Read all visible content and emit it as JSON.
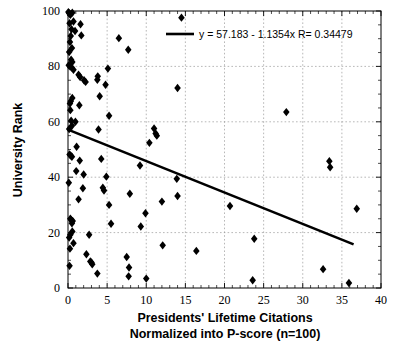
{
  "chart_data": {
    "type": "scatter",
    "title": "",
    "xlabel": "Presidents' Lifetime Citations",
    "xlabel_line2": "Normalized into P-score (n=100)",
    "ylabel": "University Rank",
    "xlim": [
      0,
      40
    ],
    "ylim": [
      0,
      100
    ],
    "xticks": [
      0,
      5,
      10,
      15,
      20,
      25,
      30,
      35,
      40
    ],
    "xtick_labels": [
      "0",
      "5",
      "10",
      "15",
      "20",
      "25",
      "30",
      "35",
      "40"
    ],
    "yticks": [
      0,
      20,
      40,
      60,
      80,
      100
    ],
    "ytick_labels": [
      "0",
      "20",
      "40",
      "60",
      "80",
      "100"
    ],
    "grid": true,
    "grid_style": "dotted",
    "minor_ticks": true,
    "legend": {
      "position": "top-right-inside",
      "entries": [
        {
          "label": "y = 57.183 - 1.1354x   R= 0.34479",
          "type": "line",
          "color": "#000000"
        }
      ]
    },
    "fit": {
      "type": "linear",
      "equation": "y = 57.183 - 1.1354x",
      "intercept": 57.183,
      "slope": -1.1354,
      "r_label": "R= 0.34479",
      "r": 0.34479,
      "x_start": 0,
      "x_end": 36.5,
      "color": "#000000"
    },
    "marker": {
      "shape": "diamond",
      "color": "#000000",
      "size": 4.2
    },
    "n_points": 100,
    "points": [
      [
        0.05,
        99.6
      ],
      [
        0.15,
        99.2
      ],
      [
        0.3,
        98.6
      ],
      [
        0.55,
        99.4
      ],
      [
        0.7,
        96.2
      ],
      [
        0.2,
        95.6
      ],
      [
        1.6,
        95.2
      ],
      [
        0.45,
        93.4
      ],
      [
        0.9,
        92.8
      ],
      [
        1.7,
        91.2
      ],
      [
        0.35,
        91.0
      ],
      [
        0.25,
        88.8
      ],
      [
        0.5,
        86.6
      ],
      [
        0.15,
        85.2
      ],
      [
        0.4,
        82.4
      ],
      [
        0.55,
        81.6
      ],
      [
        0.1,
        80.4
      ],
      [
        0.25,
        80.0
      ],
      [
        0.45,
        79.6
      ],
      [
        0.7,
        78.8
      ],
      [
        1.35,
        77.0
      ],
      [
        1.55,
        76.2
      ],
      [
        2.05,
        75.0
      ],
      [
        2.25,
        74.4
      ],
      [
        3.8,
        76.4
      ],
      [
        3.75,
        75.2
      ],
      [
        4.8,
        73.4
      ],
      [
        4.05,
        69.2
      ],
      [
        0.55,
        68.6
      ],
      [
        0.35,
        67.4
      ],
      [
        0.25,
        66.6
      ],
      [
        1.45,
        66.0
      ],
      [
        0.3,
        64.2
      ],
      [
        5.25,
        62.2
      ],
      [
        0.4,
        60.4
      ],
      [
        0.95,
        60.0
      ],
      [
        0.5,
        58.6
      ],
      [
        0.15,
        57.4
      ],
      [
        3.9,
        57.2
      ],
      [
        11.0,
        57.6
      ],
      [
        11.2,
        55.8
      ],
      [
        11.35,
        55.0
      ],
      [
        10.4,
        52.4
      ],
      [
        1.1,
        51.0
      ],
      [
        1.5,
        46.0
      ],
      [
        4.25,
        46.6
      ],
      [
        0.2,
        48.2
      ],
      [
        0.35,
        47.8
      ],
      [
        0.5,
        47.4
      ],
      [
        33.4,
        45.8
      ],
      [
        33.5,
        43.6
      ],
      [
        9.2,
        44.2
      ],
      [
        1.05,
        42.2
      ],
      [
        2.0,
        41.0
      ],
      [
        4.9,
        40.2
      ],
      [
        13.9,
        39.4
      ],
      [
        0.1,
        38.0
      ],
      [
        1.9,
        36.0
      ],
      [
        4.45,
        36.2
      ],
      [
        4.6,
        35.2
      ],
      [
        7.9,
        34.0
      ],
      [
        14.0,
        33.2
      ],
      [
        1.35,
        32.0
      ],
      [
        12.0,
        31.2
      ],
      [
        20.7,
        29.6
      ],
      [
        5.25,
        30.0
      ],
      [
        36.9,
        28.6
      ],
      [
        9.9,
        27.0
      ],
      [
        27.9,
        63.5
      ],
      [
        14.5,
        97.6
      ],
      [
        14.0,
        72.2
      ],
      [
        6.5,
        90.2
      ],
      [
        7.7,
        86.0
      ],
      [
        5.1,
        79.2
      ],
      [
        0.3,
        25.0
      ],
      [
        0.4,
        24.6
      ],
      [
        0.6,
        24.2
      ],
      [
        0.5,
        23.4
      ],
      [
        5.5,
        23.2
      ],
      [
        9.3,
        22.2
      ],
      [
        0.55,
        20.4
      ],
      [
        0.3,
        19.2
      ],
      [
        2.7,
        19.2
      ],
      [
        23.8,
        17.8
      ],
      [
        0.15,
        18.2
      ],
      [
        0.7,
        16.2
      ],
      [
        12.1,
        15.4
      ],
      [
        0.25,
        14.2
      ],
      [
        16.4,
        13.4
      ],
      [
        2.35,
        12.2
      ],
      [
        7.5,
        11.2
      ],
      [
        2.85,
        9.6
      ],
      [
        3.0,
        9.2
      ],
      [
        3.1,
        8.6
      ],
      [
        0.2,
        8.0
      ],
      [
        7.8,
        7.4
      ],
      [
        32.6,
        6.8
      ],
      [
        3.75,
        5.2
      ],
      [
        7.75,
        4.2
      ],
      [
        10.0,
        3.4
      ],
      [
        23.6,
        2.8
      ],
      [
        35.9,
        1.8
      ]
    ]
  }
}
